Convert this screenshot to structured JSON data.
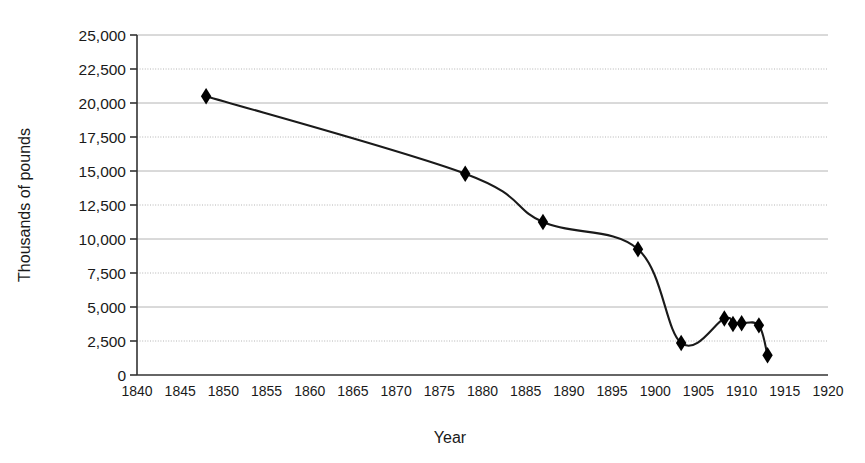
{
  "chart_data": {
    "type": "line",
    "title": "",
    "subtitle": "",
    "xlabel": "Year",
    "ylabel": "Thousands of pounds",
    "xlim": [
      1840,
      1920
    ],
    "ylim": [
      0,
      25000
    ],
    "grid": true,
    "legend": "none",
    "marker": "diamond",
    "line_color": "#1a1a1a",
    "marker_color": "#000000",
    "grid_color": "#b4b4b4",
    "axis_color": "#333333",
    "x_ticks": [
      1840,
      1845,
      1850,
      1855,
      1860,
      1865,
      1870,
      1875,
      1880,
      1885,
      1890,
      1895,
      1900,
      1905,
      1910,
      1915,
      1920
    ],
    "x_tick_labels": [
      "1840",
      "1845",
      "1850",
      "1855",
      "1860",
      "1865",
      "1870",
      "1875",
      "1880",
      "1885",
      "1890",
      "1895",
      "1900",
      "1905",
      "1910",
      "1915",
      "1920"
    ],
    "y_ticks": [
      0,
      2500,
      5000,
      7500,
      10000,
      12500,
      15000,
      17500,
      20000,
      22500,
      25000
    ],
    "y_tick_labels": [
      "0",
      "2,500",
      "5,000",
      "7,500",
      "10,000",
      "12,500",
      "15,000",
      "17,500",
      "20,000",
      "22,500",
      "25,000"
    ],
    "series": [
      {
        "name": "Thousands of pounds",
        "x": [
          1848,
          1878,
          1887,
          1898,
          1903,
          1908,
          1909,
          1910,
          1912,
          1913
        ],
        "values": [
          20500,
          14800,
          11250,
          9250,
          2350,
          4150,
          3750,
          3800,
          3650,
          1450
        ],
        "points": [
          {
            "year": 1848,
            "value": 20500
          },
          {
            "year": 1878,
            "value": 14800
          },
          {
            "year": 1887,
            "value": 11250
          },
          {
            "year": 1898,
            "value": 9250
          },
          {
            "year": 1903,
            "value": 2350
          },
          {
            "year": 1908,
            "value": 4150
          },
          {
            "year": 1909,
            "value": 3750
          },
          {
            "year": 1910,
            "value": 3800
          },
          {
            "year": 1912,
            "value": 3650
          },
          {
            "year": 1913,
            "value": 1450
          }
        ]
      }
    ]
  }
}
